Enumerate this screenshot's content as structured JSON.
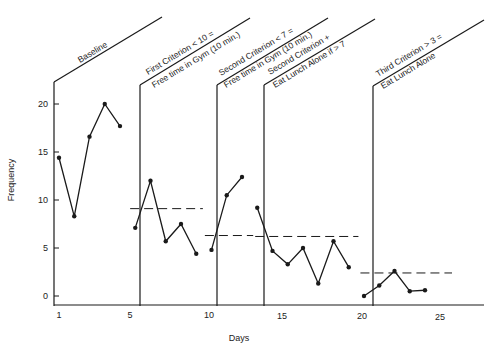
{
  "chart_data": {
    "type": "line",
    "title": "",
    "xlabel": "Days",
    "ylabel": "Frequency",
    "xlim": [
      0.5,
      27.5
    ],
    "ylim": [
      -1,
      22
    ],
    "x_ticks": [
      1,
      5,
      10,
      15,
      20,
      25
    ],
    "y_ticks": [
      0,
      5,
      10,
      15,
      20
    ],
    "grid": false,
    "legend": null,
    "phases": [
      {
        "name": "Baseline",
        "labels": [
          "Baseline"
        ],
        "start_day": 0.5,
        "end_day": 5.6,
        "criterion": null,
        "x": [
          1,
          2,
          3,
          4,
          5
        ],
        "y": [
          14.4,
          8.3,
          16.6,
          20,
          17.7
        ]
      },
      {
        "name": "First Criterion",
        "labels": [
          "First Criterion < 10 =",
          "Free time in Gym (10 min.)"
        ],
        "start_day": 5.6,
        "end_day": 10.5,
        "criterion": 9.1,
        "x": [
          6,
          7,
          8,
          9,
          10
        ],
        "y": [
          7.1,
          12,
          5.7,
          7.5,
          4.4
        ]
      },
      {
        "name": "Second Criterion",
        "labels": [
          "Second Criterion < 7 =",
          "Free time in Gym (10 min.)"
        ],
        "start_day": 10.5,
        "end_day": 13.8,
        "criterion": 6.3,
        "x": [
          11,
          12,
          13
        ],
        "y": [
          4.8,
          10.5,
          12.4
        ]
      },
      {
        "name": "Second Criterion + Eat Lunch Alone",
        "labels": [
          "Second Criterion +",
          "Eat Lunch Alone if > 7"
        ],
        "start_day": 13.8,
        "end_day": 20.7,
        "criterion": 6.2,
        "x": [
          14,
          15,
          16,
          17,
          18,
          19,
          20
        ],
        "y": [
          9.2,
          4.7,
          3.3,
          5,
          1.3,
          5.7,
          3
        ]
      },
      {
        "name": "Third Criterion",
        "labels": [
          "Third Criterion > 3 =",
          "Eat Lunch Alone"
        ],
        "start_day": 20.7,
        "end_day": 27.5,
        "criterion": 2.4,
        "x": [
          21,
          22,
          23,
          24,
          25
        ],
        "y": [
          0,
          1.1,
          2.6,
          0.5,
          0.6
        ]
      }
    ]
  },
  "axes": {
    "xlabel": "Days",
    "ylabel": "Frequency",
    "x_tick_labels": [
      "1",
      "5",
      "10",
      "15",
      "20",
      "25"
    ],
    "y_tick_labels": [
      "0",
      "5",
      "10",
      "15",
      "20"
    ]
  },
  "phase_labels": {
    "p1_line1": "Baseline",
    "p2_line1": "First Criterion < 10 =",
    "p2_line2": "Free time in Gym (10 min.)",
    "p3_line1": "Second Criterion < 7 =",
    "p3_line2": "Free time in Gym (10 min.)",
    "p4_line1": "Second Criterion +",
    "p4_line2": "Eat Lunch Alone if > 7",
    "p5_line1": "Third Criterion > 3 =",
    "p5_line2": "Eat Lunch Alone"
  },
  "colors": {
    "ink": "#1a1a1a",
    "background": "#ffffff"
  }
}
